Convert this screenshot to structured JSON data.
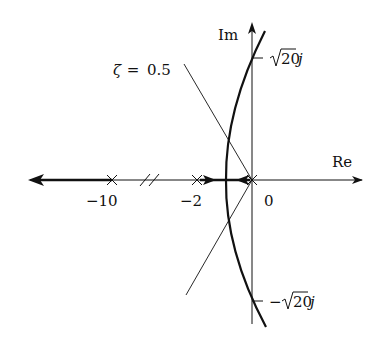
{
  "diagram": {
    "type": "root-locus",
    "axes": {
      "real_label": "Re",
      "imag_label": "Im"
    },
    "poles": [
      {
        "value": -10,
        "label": "−10"
      },
      {
        "value": -2,
        "label": "−2"
      },
      {
        "value": 0,
        "label": "0"
      }
    ],
    "imag_ticks": [
      {
        "label_prefix": "",
        "label_radical": "20",
        "label_suffix": "j"
      },
      {
        "label_prefix": "−",
        "label_radical": "20",
        "label_suffix": "j"
      }
    ],
    "damping_line": {
      "zeta_symbol": "ζ",
      "equals": " = ",
      "value": "0.5"
    },
    "colors": {
      "ink": "#111111",
      "background": "#ffffff"
    }
  }
}
